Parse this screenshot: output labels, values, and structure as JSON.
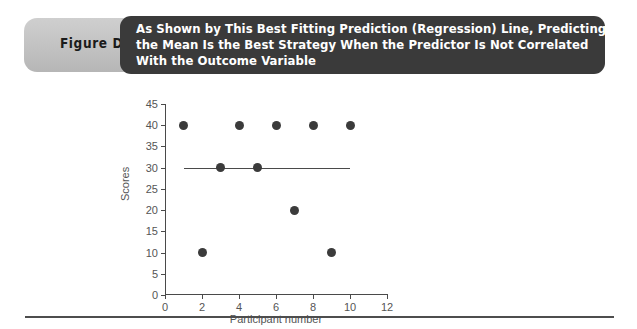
{
  "figure": {
    "label": "Figure D-5",
    "title_lines": [
      "As Shown by This Best Fitting Prediction (Regression) Line, Predicting",
      "the Mean Is the Best Strategy When the Predictor Is Not Correlated",
      "With the Outcome Variable"
    ],
    "banner_color": "#3a3a3a",
    "label_pill_color": "#c4c4c4",
    "title_text_color": "#ffffff"
  },
  "chart_data": {
    "type": "scatter",
    "title": "",
    "xlabel": "Participant number",
    "ylabel": "Scores",
    "xlim": [
      0,
      12
    ],
    "ylim": [
      0,
      45
    ],
    "xticks": [
      0,
      2,
      4,
      6,
      8,
      10,
      12
    ],
    "yticks": [
      0,
      5,
      10,
      15,
      20,
      25,
      30,
      35,
      40,
      45
    ],
    "grid": false,
    "legend": null,
    "marker_color": "#3b3b3b",
    "line_color": "#4a4a4a",
    "x": [
      1,
      2,
      3,
      4,
      5,
      6,
      7,
      8,
      9,
      10
    ],
    "y": [
      40,
      10,
      30,
      40,
      30,
      40,
      20,
      40,
      10,
      40
    ],
    "points": [
      {
        "x": 1,
        "y": 40
      },
      {
        "x": 2,
        "y": 10
      },
      {
        "x": 3,
        "y": 30
      },
      {
        "x": 4,
        "y": 40
      },
      {
        "x": 5,
        "y": 30
      },
      {
        "x": 6,
        "y": 40
      },
      {
        "x": 7,
        "y": 20
      },
      {
        "x": 8,
        "y": 40
      },
      {
        "x": 9,
        "y": 10
      },
      {
        "x": 10,
        "y": 40
      }
    ],
    "regression_line": {
      "label": "Best fitting prediction (regression) line",
      "x_start": 1,
      "x_end": 10,
      "y_start": 30,
      "y_end": 30,
      "slope": 0,
      "intercept": 30
    }
  }
}
